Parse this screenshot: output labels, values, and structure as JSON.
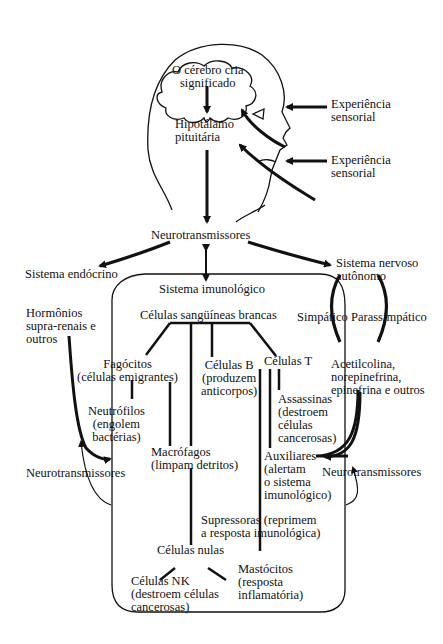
{
  "head": {
    "brain": [
      "O cérebro cria",
      "significado"
    ],
    "hypothalamus": [
      "Hipotálamo",
      "pituitária"
    ],
    "sensory_1": [
      "Experiência",
      "sensorial"
    ],
    "sensory_2": [
      "Experiência",
      "sensorial"
    ]
  },
  "neurotransmitters_top": "Neurotransmissores",
  "endocrine": {
    "title": "Sistema endócrino",
    "hormones": [
      "Hormônios",
      "supra-renais e",
      "outros"
    ],
    "neurotransmitters": "Neurotransmissores"
  },
  "autonomic": {
    "title": [
      "Sistema nervoso",
      "autônomo"
    ],
    "sympathetic": "Simpático",
    "parasympathetic": "Parassimpático",
    "chemicals": [
      "Acetilcolina,",
      "norepinefrina,",
      "epinefrina e outros"
    ],
    "neurotransmitters": "Neurotransmissores"
  },
  "immune": {
    "title": "Sistema imunológico",
    "white_blood_cells": "Células sangüíneas brancas",
    "phagocytes": [
      "Fagócitos",
      "(células emigrantes)"
    ],
    "neutrophils": [
      "Neutrófilos",
      "(engolem",
      "bactérias)"
    ],
    "macrophages": [
      "Macrófagos",
      "(limpam detritos)"
    ],
    "b_cells": [
      "Células B",
      "(produzem",
      "anticorpos)"
    ],
    "t_cells": "Células T",
    "killers": [
      "Assassinas",
      "(destroem",
      "células",
      "cancerosas)"
    ],
    "helpers": [
      "Auxiliares",
      "(alertam",
      "o sistema",
      "imunológico)"
    ],
    "suppressors": [
      "Supressoras (reprimem",
      "a resposta imunológica)"
    ],
    "null_cells": "Células nulas",
    "nk_cells": [
      "Células NK",
      "(destroem células",
      "cancerosas)"
    ],
    "mast_cells": [
      "Mastócitos",
      "(resposta",
      "inflamatória)"
    ]
  }
}
